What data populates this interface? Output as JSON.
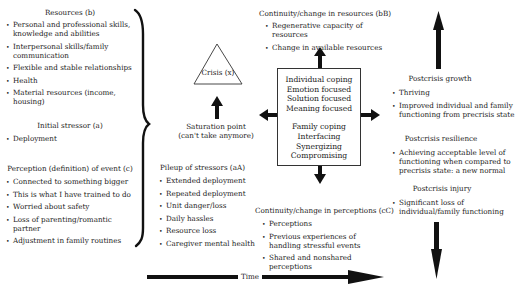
{
  "resources": {
    "title": "Resources (b)",
    "items": [
      "Personal and professional skills, knowledge and abilities",
      "Interpersonal skills/family communication",
      "Flexible and stable relationships",
      "Health",
      "Material resources (income, housing)"
    ]
  },
  "initial_stressor": {
    "title": "Initial stressor (a)",
    "items": [
      "Deployment"
    ]
  },
  "perception": {
    "title": "Perception (definition) of event (c)",
    "items": [
      "Connected to something bigger",
      "This is what I have trained to do",
      "Worried about safety",
      "Loss of parenting/romantic partner",
      "Adjustment in family routines"
    ]
  },
  "crisis": {
    "label": "Crisis (x)"
  },
  "saturation": {
    "line1": "Saturation point",
    "line2": "(can't take anymore)"
  },
  "pileup": {
    "title": "Pileup of stressors (aA)",
    "items": [
      "Extended deployment",
      "Repeated deployment",
      "Unit danger/loss",
      "Daily hassles",
      "Resource loss",
      "Caregiver mental health"
    ]
  },
  "continuity_resources": {
    "title": "Continuity/change in resources (bB)",
    "items": [
      "Regenerative capacity of resources",
      "Change in available resources"
    ]
  },
  "coping_box": {
    "individual": [
      "Individual coping",
      "Emotion focused",
      "Solution focused",
      "Meaning focused"
    ],
    "family": [
      "Family coping",
      "Interfacing",
      "Synergizing",
      "Compromising"
    ]
  },
  "continuity_perceptions": {
    "title": "Continuity/change in perceptions (cC)",
    "items": [
      "Perceptions",
      "Previous experiences of handling stressful events",
      "Shared and nonshared perceptions"
    ]
  },
  "postcrisis_growth": {
    "title": "Postcrisis growth",
    "items": [
      "Thriving",
      "Improved individual and family functioning from precrisis state"
    ]
  },
  "postcrisis_resilience": {
    "title": "Postcrisis resilience",
    "items": [
      "Achieving acceptable level of functioning when compared to precrisis state:  a new normal"
    ]
  },
  "postcrisis_injury": {
    "title": "Postcrisis injury",
    "items": [
      "Significant loss of individual/family functioning"
    ]
  },
  "time_axis": {
    "label": "Time"
  },
  "colors": {
    "ink": "#1a1a1a",
    "background": "#ffffff"
  }
}
